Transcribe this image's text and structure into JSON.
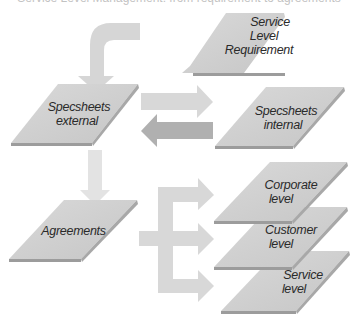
{
  "diagram": {
    "title_cutoff": "Service Level Management: from requirement to agreements",
    "colors": {
      "card_fill": "#cfcfcf",
      "card_edge": "#9c9c9c",
      "arrow_light": "#dadada",
      "arrow_dark": "#b3b3b3",
      "text": "#2a2a2a"
    },
    "nodes": {
      "slr": {
        "lines": [
          "Service",
          "Level",
          "Requirement"
        ]
      },
      "spec_external": {
        "lines": [
          "Specsheets",
          "external"
        ]
      },
      "spec_internal": {
        "lines": [
          "Specsheets",
          "internal"
        ]
      },
      "agreements": {
        "lines": [
          "Agreements"
        ]
      },
      "corporate": {
        "lines": [
          "Corporate",
          "level"
        ]
      },
      "customer": {
        "lines": [
          "Customer",
          "level"
        ]
      },
      "service": {
        "lines": [
          "Service",
          "level"
        ]
      }
    },
    "edges": [
      {
        "from": "Service Level Requirement",
        "to": "Specsheets external",
        "style": "light"
      },
      {
        "from": "Specsheets external",
        "to": "Specsheets internal",
        "style": "light"
      },
      {
        "from": "Specsheets internal",
        "to": "Specsheets external",
        "style": "dark"
      },
      {
        "from": "Specsheets external",
        "to": "Agreements",
        "style": "light"
      },
      {
        "from": "Agreements",
        "to": "Corporate level",
        "style": "light"
      },
      {
        "from": "Agreements",
        "to": "Customer level",
        "style": "light"
      },
      {
        "from": "Agreements",
        "to": "Service level",
        "style": "light"
      }
    ]
  }
}
